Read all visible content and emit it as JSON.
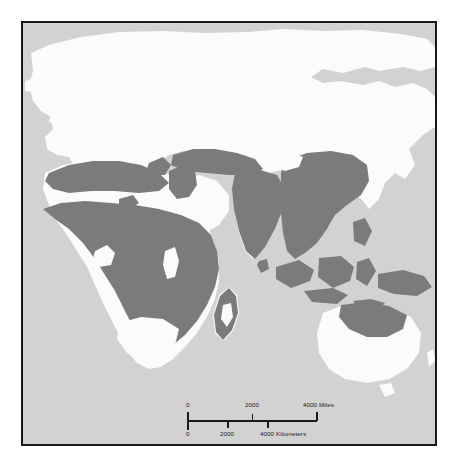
{
  "figure": {
    "type": "distribution-range-map",
    "projection_extent": "Old World — Europe, Africa, Asia, Australia",
    "colors": {
      "page_background": "#ffffff",
      "ocean": "#d2d2d2",
      "land_outside_range": "#fbfbfb",
      "land_in_range": "#7b7b7b",
      "frame_border": "#16181a",
      "scale_bar_ink": "#1a1a1a"
    }
  },
  "map": {
    "ocean_fill": "#d2d2d2",
    "land_fill": "#fbfbfb",
    "range_fill": "#7b7b7b",
    "range_regions": [
      "Maghreb / Mediterranean North Africa",
      "Sub-Saharan Africa",
      "Coastal Madagascar",
      "Central Asia (Caspian–Aral belt)",
      "Indian subcontinent",
      "Southern China and Indochina",
      "Indonesia and Malaysia",
      "Philippines",
      "New Guinea",
      "Northern Australia (Cape York)"
    ],
    "excluded_regions": [
      "Northern and Western Europe",
      "Siberia / Northern Asia",
      "Arabian Peninsula interior",
      "Sahara interior",
      "Southern Africa",
      "Most of Australia"
    ]
  },
  "scale": {
    "miles": {
      "unit_label": "Miles",
      "ticks": [
        "0",
        "2000",
        "4000"
      ],
      "tick_values": [
        0,
        2000,
        4000
      ],
      "end_label": "4000 Miles"
    },
    "kilometers": {
      "unit_label": "Kilometers",
      "ticks": [
        "0",
        "2000",
        "4000"
      ],
      "tick_values": [
        0,
        2000,
        4000
      ],
      "end_label": "4000 Kilometers"
    }
  }
}
